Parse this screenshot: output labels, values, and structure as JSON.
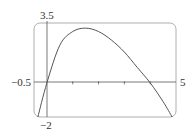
{
  "chart_data": {
    "type": "line",
    "title": "",
    "xlabel": "",
    "ylabel": "",
    "xlim": [
      -0.5,
      5
    ],
    "ylim": [
      -2,
      3.5
    ],
    "grid": false,
    "x_tick_marks": [
      1,
      2,
      3,
      4
    ],
    "tick_labels": {
      "x_min": "−0.5",
      "x_max": "5",
      "y_max": "3.5",
      "y_min": "−2"
    },
    "series": [
      {
        "name": "f(x)",
        "x": [
          -0.35,
          0,
          0.5,
          1,
          1.5,
          2,
          2.5,
          3,
          3.5,
          4,
          4.5,
          4.85
        ],
        "y": [
          -2,
          0,
          2.2,
          3.0,
          3.2,
          3.0,
          2.5,
          1.8,
          0.9,
          0,
          -1.1,
          -2
        ]
      }
    ]
  },
  "colors": {
    "curve": "#555555",
    "axes": "#666666",
    "frame": "#999999"
  }
}
